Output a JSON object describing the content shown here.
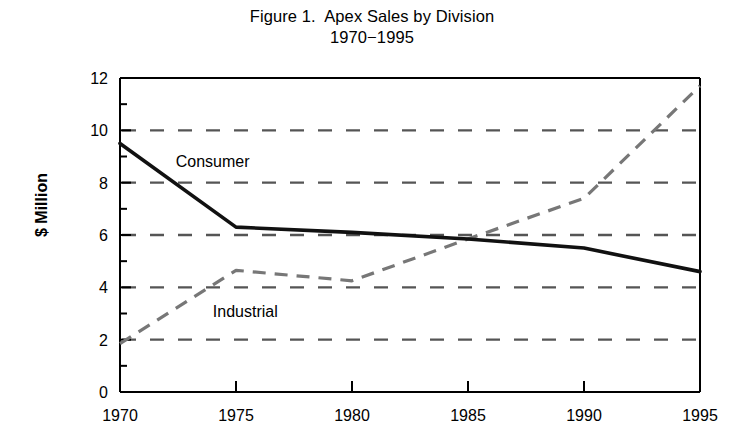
{
  "figure": {
    "title": "Figure 1.  Apex Sales by Division",
    "subtitle": "1970−1995",
    "ylabel": "$ Million"
  },
  "labels": {
    "consumer": "Consumer",
    "industrial": "Industrial"
  },
  "axis": {
    "y_ticks": [
      "0",
      "2",
      "4",
      "6",
      "8",
      "10",
      "12"
    ],
    "x_ticks": [
      "1970",
      "1975",
      "1980",
      "1985",
      "1990",
      "1995"
    ]
  },
  "colors": {
    "consumer_line": "#111111",
    "industrial_line": "#777777",
    "gridline": "#555555",
    "axis": "#000000",
    "background": "#ffffff"
  },
  "chart_data": {
    "type": "line",
    "title": "Figure 1.  Apex Sales by Division",
    "subtitle": "1970−1995",
    "xlabel": "",
    "ylabel": "$ Million",
    "x": [
      1970,
      1975,
      1980,
      1985,
      1990,
      1995
    ],
    "xlim": [
      1970,
      1995
    ],
    "ylim": [
      0,
      12
    ],
    "y_major_ticks": [
      0,
      2,
      4,
      6,
      8,
      10,
      12
    ],
    "y_minor_ticks": [
      1,
      3,
      5,
      7,
      9,
      11
    ],
    "gridlines": [
      2,
      4,
      6,
      8,
      10
    ],
    "grid": "horizontal-dashed",
    "legend": "inline-labels",
    "series": [
      {
        "name": "Consumer",
        "style": "solid",
        "color": "#111111",
        "values": [
          9.5,
          6.3,
          6.1,
          5.85,
          5.5,
          4.6
        ]
      },
      {
        "name": "Industrial",
        "style": "dashed",
        "color": "#777777",
        "values": [
          1.85,
          4.65,
          4.25,
          5.85,
          7.4,
          11.7
        ]
      }
    ],
    "annotations": [
      {
        "text": "Consumer",
        "x": 1972.4,
        "y": 8.6
      },
      {
        "text": "Industrial",
        "x": 1974.0,
        "y": 2.85
      }
    ]
  }
}
